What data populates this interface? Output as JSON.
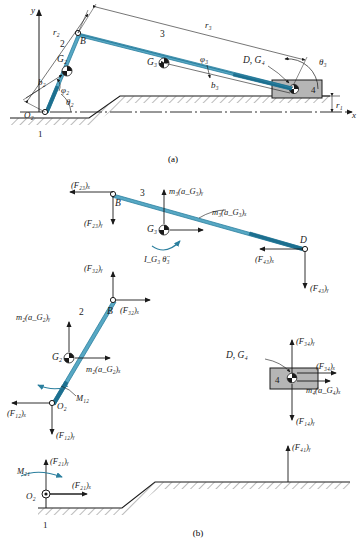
{
  "figure": {
    "caption_a": "(a)",
    "caption_b": "(b)",
    "accent_color": "#2b7f9e",
    "line_color": "#1a1a1a",
    "hatch_color": "#555555",
    "slider_fill": "#b5b5b5"
  },
  "diagram_a": {
    "title": "Slider-crank mechanism kinematic diagram",
    "axes": {
      "x_label": "x",
      "y_label": "y"
    },
    "links": [
      {
        "number": "1",
        "name": "ground-link"
      },
      {
        "number": "2",
        "name": "crank-link"
      },
      {
        "number": "3",
        "name": "coupler-link"
      },
      {
        "number": "4",
        "name": "slider-link"
      }
    ],
    "joints": [
      {
        "label": "O₂",
        "name": "joint-o2"
      },
      {
        "label": "B",
        "name": "joint-b"
      },
      {
        "label": "D, G₄",
        "name": "joint-d-g4"
      }
    ],
    "mass_centers": [
      {
        "label": "G₂",
        "name": "center-of-mass-g2"
      },
      {
        "label": "G₃",
        "name": "center-of-mass-g3"
      }
    ],
    "dimensions": [
      {
        "label": "r₁",
        "name": "dimension-r1"
      },
      {
        "label": "r₂",
        "name": "dimension-r2"
      },
      {
        "label": "r₃",
        "name": "dimension-r3"
      },
      {
        "label": "b₂",
        "name": "dimension-b2"
      },
      {
        "label": "b₃",
        "name": "dimension-b3"
      }
    ],
    "angles": [
      {
        "label": "θ₂",
        "name": "angle-theta2"
      },
      {
        "label": "θ₃",
        "name": "angle-theta3"
      },
      {
        "label": "φ₂",
        "name": "angle-phi2"
      },
      {
        "label": "φ₃",
        "name": "angle-phi3"
      }
    ]
  },
  "diagram_b": {
    "title": "Free-body diagrams",
    "coupler_fbd": {
      "name": "coupler-free-body-diagram",
      "link_number": "3",
      "joint_b": "B",
      "joint_d": "D",
      "mass_center": "G₃",
      "forces": [
        {
          "label": "(F₂₃)ₓ",
          "name": "force-f23x"
        },
        {
          "label": "(F₂₃)ᵧ",
          "name": "force-f23y"
        },
        {
          "label": "(F₄₃)ₓ",
          "name": "force-f43x"
        },
        {
          "label": "(F₄₃)ᵧ",
          "name": "force-f43y"
        }
      ],
      "inertia": [
        {
          "label": "m₃(a_G₃)ᵧ",
          "name": "inertia-m3-ag3y"
        },
        {
          "label": "m₃(a_G₃)ₓ",
          "name": "inertia-m3-ag3x"
        },
        {
          "label": "I_G₃ θ̈₃",
          "name": "inertia-moment-ig3"
        }
      ]
    },
    "crank_fbd": {
      "name": "crank-free-body-diagram",
      "link_number": "2",
      "joint_b": "B",
      "joint_o2": "O₂",
      "mass_center": "G₂",
      "forces": [
        {
          "label": "(F₃₂)ᵧ",
          "name": "force-f32y"
        },
        {
          "label": "(F₃₂)ₓ",
          "name": "force-f32x"
        },
        {
          "label": "(F₁₂)ₓ",
          "name": "force-f12x"
        },
        {
          "label": "(F₁₂)ᵧ",
          "name": "force-f12y"
        }
      ],
      "inertia": [
        {
          "label": "m₂(a_G₂)ᵧ",
          "name": "inertia-m2-ag2y"
        },
        {
          "label": "m₂(a_G₂)ₓ",
          "name": "inertia-m2-ag2x"
        }
      ],
      "moment": {
        "label": "M₁₂",
        "name": "moment-m12"
      }
    },
    "slider_fbd": {
      "name": "slider-free-body-diagram",
      "link_number": "4",
      "point_label": "D, G₄",
      "forces": [
        {
          "label": "(F₃₄)ᵧ",
          "name": "force-f34y"
        },
        {
          "label": "(F₃₄)ₓ",
          "name": "force-f34x"
        },
        {
          "label": "(F₁₄)ᵧ",
          "name": "force-f14y"
        }
      ],
      "inertia": [
        {
          "label": "m₄(a_G₄)ₓ",
          "name": "inertia-m4-ag4x"
        }
      ]
    },
    "ground_fbd": {
      "name": "ground-free-body-diagram",
      "link_number": "1",
      "joint_o2": "O₂",
      "forces": [
        {
          "label": "(F₂₁)ᵧ",
          "name": "force-f21y"
        },
        {
          "label": "(F₂₁)ₓ",
          "name": "force-f21x"
        },
        {
          "label": "(F₄₁)ᵧ",
          "name": "force-f41y"
        }
      ],
      "moment": {
        "label": "M₂₁",
        "name": "moment-m21"
      }
    }
  }
}
